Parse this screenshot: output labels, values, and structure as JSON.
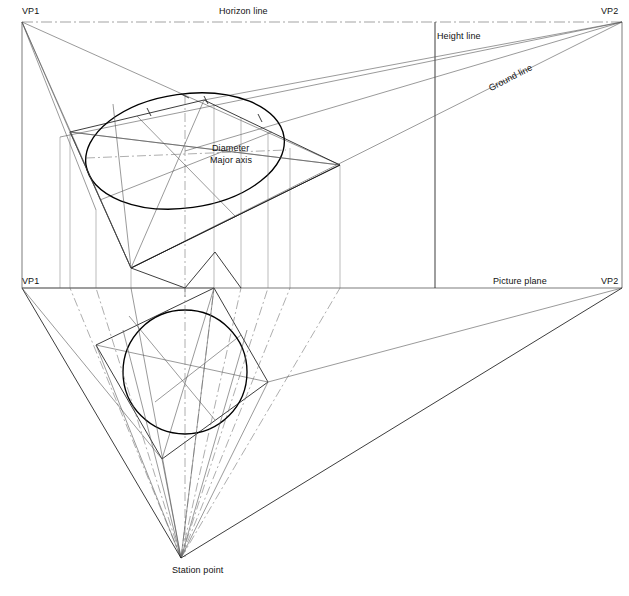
{
  "drawing": {
    "title": "Two-point perspective construction of a circle",
    "canvas": {
      "width": 629,
      "height": 596,
      "background": "#ffffff"
    },
    "colors": {
      "heavy": "#000000",
      "thin": "#555555",
      "hairline": "#777777",
      "chain": "#666666",
      "text": "#111111"
    }
  },
  "labels": {
    "vp1_top": "VP1",
    "vp2_top": "VP2",
    "horizon_line": "Horizon line",
    "height_line": "Height line",
    "ground_line": "Ground line",
    "diameter": "Diameter",
    "major_axis": "Major axis",
    "vp1_bottom": "VP1",
    "vp2_bottom": "VP2",
    "picture_plane": "Picture plane",
    "station_point": "Station point"
  },
  "points": {
    "vp1_top": [
      22,
      22
    ],
    "vp2_top": [
      622,
      22
    ],
    "vp1_plane": [
      22,
      288
    ],
    "vp2_plane": [
      622,
      288
    ],
    "station_point": [
      181,
      558
    ],
    "height_line_x": 435,
    "horizon_y": 22,
    "picture_plane_y": 288,
    "ellipse_center": [
      185,
      151
    ],
    "ellipse_rx": 100,
    "ellipse_ry": 57,
    "ellipse_rotation": -8,
    "circle_center": [
      185,
      372
    ],
    "circle_r": 62,
    "plan_square": [
      [
        96,
        345
      ],
      [
        214,
        288
      ],
      [
        268,
        382
      ],
      [
        162,
        459
      ]
    ],
    "perspective_square": [
      [
        70,
        132
      ],
      [
        204,
        100
      ],
      [
        340,
        165
      ],
      [
        131,
        268
      ]
    ],
    "right_vertex": [
      340,
      165
    ],
    "left_vertex": [
      70,
      132
    ]
  },
  "geometry": {
    "vertical_projectors_x": [
      22,
      60,
      70,
      96,
      131,
      162,
      185,
      214,
      241,
      268,
      290,
      340,
      435,
      622
    ],
    "ellipse_tick_count": 4,
    "diameter_label_anchor": [
      212,
      148
    ],
    "major_axis_label_anchor": [
      210,
      160
    ]
  }
}
